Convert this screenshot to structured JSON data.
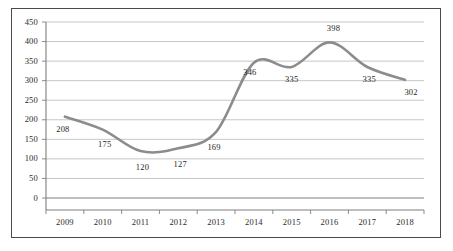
{
  "chart_data": {
    "type": "line",
    "title": "",
    "xlabel": "",
    "ylabel": "",
    "categories": [
      "2009",
      "2010",
      "2011",
      "2012",
      "2013",
      "2014",
      "2015",
      "2016",
      "2017",
      "2018"
    ],
    "values": [
      208,
      175,
      120,
      127,
      169,
      346,
      335,
      398,
      335,
      302
    ],
    "point_labels": [
      "208",
      "175",
      "120",
      "127",
      "169",
      "346",
      "335",
      "398",
      "335",
      "302"
    ],
    "ylim": [
      0,
      450
    ],
    "yticks": [
      "0",
      "50",
      "100",
      "150",
      "200",
      "250",
      "300",
      "350",
      "400",
      "450"
    ],
    "ytick_values": [
      0,
      50,
      100,
      150,
      200,
      250,
      300,
      350,
      400,
      450
    ],
    "grid": true,
    "legend": "none",
    "series_color": "#8c8c8c",
    "grid_color": "#bfbfbf",
    "axis_color": "#7f7f7f",
    "border_color": "#4a4a4a",
    "background": "#ffffff",
    "smoothing": "spline"
  }
}
